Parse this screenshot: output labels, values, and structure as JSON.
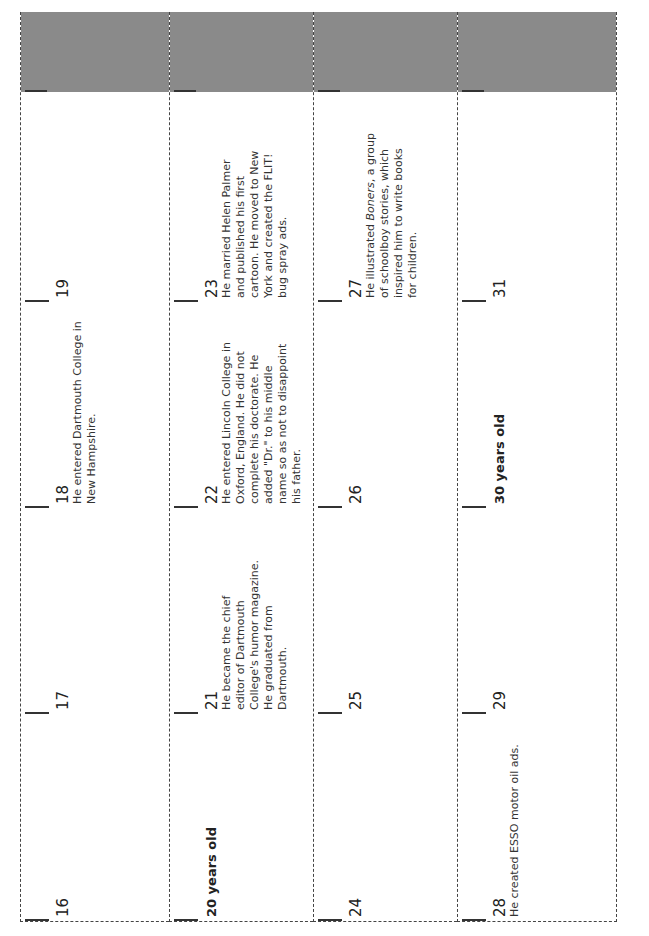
{
  "header_band_color": "#8a8a8a",
  "rows": [
    {
      "cells": [
        {
          "age": "16",
          "bold": false,
          "desc": ""
        },
        {
          "age": "17",
          "bold": false,
          "desc": ""
        },
        {
          "age": "18",
          "bold": false,
          "desc": "He entered Dartmouth College in New Hampshire."
        },
        {
          "age": "19",
          "bold": false,
          "desc": ""
        }
      ]
    },
    {
      "cells": [
        {
          "age": "20 years old",
          "bold": true,
          "desc": ""
        },
        {
          "age": "21",
          "bold": false,
          "desc": "He became the chief editor of Dartmouth College's humor magazine. He graduated from Dartmouth."
        },
        {
          "age": "22",
          "bold": false,
          "desc": "He entered Lincoln College in Oxford, England. He did not complete his doctorate. He added \"Dr.\" to his middle name so as not to disappoint his father."
        },
        {
          "age": "23",
          "bold": false,
          "desc": "He married Helen Palmer and published his first cartoon. He moved to New York and created the FLIT! bug spray ads."
        }
      ]
    },
    {
      "cells": [
        {
          "age": "24",
          "bold": false,
          "desc": ""
        },
        {
          "age": "25",
          "bold": false,
          "desc": ""
        },
        {
          "age": "26",
          "bold": false,
          "desc": ""
        },
        {
          "age": "27",
          "bold": false,
          "desc": "He illustrated Boners, a group of schoolboy stories, which inspired him to write books for children."
        }
      ]
    },
    {
      "cells": [
        {
          "age": "28",
          "bold": false,
          "desc": "He created ESSO motor oil ads."
        },
        {
          "age": "29",
          "bold": false,
          "desc": ""
        },
        {
          "age": "30 years old",
          "bold": true,
          "desc": ""
        },
        {
          "age": "31",
          "bold": false,
          "desc": ""
        }
      ]
    }
  ]
}
